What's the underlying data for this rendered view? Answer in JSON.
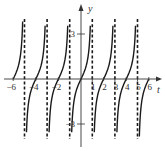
{
  "chart_data": {
    "type": "line",
    "title": "",
    "function": "y = tan(pi*t/2)",
    "xlabel": "t",
    "ylabel": "y",
    "xlim": [
      -6,
      6
    ],
    "ylim": [
      -4,
      4
    ],
    "x_ticks": [
      {
        "value": -6,
        "label": "-6"
      },
      {
        "value": -4,
        "label": "-4"
      },
      {
        "value": -2,
        "label": "-2"
      },
      {
        "value": 1,
        "label": "1"
      },
      {
        "value": 2,
        "label": "2"
      },
      {
        "value": 3,
        "label": "3"
      },
      {
        "value": 4,
        "label": "4"
      },
      {
        "value": 5,
        "label": "5"
      },
      {
        "value": 6,
        "label": "6"
      }
    ],
    "y_ticks": [
      {
        "value": 3,
        "label": "3"
      },
      {
        "value": -3,
        "label": "-3"
      }
    ],
    "asymptotes": [
      -5,
      -3,
      -1,
      1,
      3,
      5
    ],
    "zeros": [
      -6,
      -4,
      -2,
      0,
      2,
      4,
      6
    ],
    "grid": false,
    "legend": null,
    "colors": {
      "curve": "#1a1a1a",
      "axis": "#333333",
      "asymptote": "#1a1a1a"
    }
  }
}
